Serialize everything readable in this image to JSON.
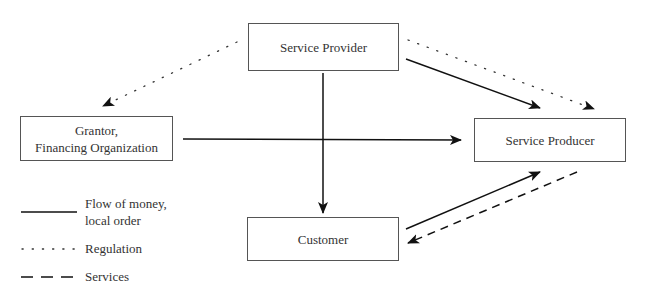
{
  "diagram": {
    "nodes": {
      "service_provider": {
        "label": "Service Provider"
      },
      "grantor": {
        "line1": "Grantor,",
        "line2": "Financing Organization"
      },
      "service_producer": {
        "label": "Service Producer"
      },
      "customer": {
        "label": "Customer"
      }
    },
    "edges": [
      {
        "from": "Service Provider",
        "to": "Grantor, Financing Organization",
        "style": "dotted",
        "meaning": "Regulation"
      },
      {
        "from": "Service Provider",
        "to": "Service Producer",
        "style": "dotted",
        "meaning": "Regulation"
      },
      {
        "from": "Service Provider",
        "to": "Service Producer",
        "style": "solid",
        "meaning": "Flow of money, local order"
      },
      {
        "from": "Service Provider",
        "to": "Customer",
        "style": "solid",
        "meaning": "Flow of money, local order"
      },
      {
        "from": "Grantor, Financing Organization",
        "to": "Service Producer",
        "style": "solid",
        "meaning": "Flow of money, local order"
      },
      {
        "from": "Customer",
        "to": "Service Producer",
        "style": "solid",
        "meaning": "Flow of money, local order"
      },
      {
        "from": "Service Producer",
        "to": "Customer",
        "style": "dashed",
        "meaning": "Services"
      }
    ],
    "legend": {
      "solid_line1": "Flow of money,",
      "solid_line2": "local order",
      "dotted": "Regulation",
      "dashed": "Services"
    },
    "colors": {
      "line": "#111111",
      "border": "#555555",
      "text": "#333333"
    }
  }
}
